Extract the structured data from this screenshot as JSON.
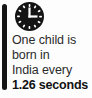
{
  "card": {
    "accent_color": "#141414",
    "background_color": "#fdfdfd",
    "text_color": "#2b2b2b",
    "icon": {
      "name": "clock-icon",
      "face_color": "#141414",
      "marks_color": "#ffffff",
      "hands_color": "#ffffff",
      "hour_marks": 12,
      "time_shown": "3:00"
    },
    "statistic": {
      "lines": [
        "One child is",
        "born in",
        "India every"
      ],
      "emphasis_line": "1.26 seconds",
      "full_text": "One child is born in India every 1.26 seconds"
    }
  }
}
